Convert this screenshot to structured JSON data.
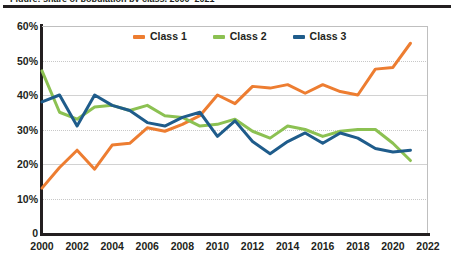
{
  "page": {
    "clipped_heading": "Figure: share of population by class, 2000–2021",
    "background_color": "#ffffff"
  },
  "legend": {
    "position": "top-center",
    "items": [
      {
        "label": "Class 1",
        "color": "#ED7D31",
        "swatch": "line-swatch"
      },
      {
        "label": "Class 2",
        "color": "#8CC152",
        "swatch": "line-swatch"
      },
      {
        "label": "Class 3",
        "color": "#1F5C8B",
        "swatch": "line-swatch"
      }
    ]
  },
  "axes": {
    "y_ticks": [
      "0",
      "10%",
      "20%",
      "30%",
      "40%",
      "50%",
      "60%"
    ],
    "y_tick_values": [
      0,
      10,
      20,
      30,
      40,
      50,
      60
    ],
    "x_ticks": [
      "2000",
      "2002",
      "2004",
      "2006",
      "2008",
      "2010",
      "2012",
      "2014",
      "2016",
      "2018",
      "2020",
      "2022"
    ],
    "x_tick_values": [
      2000,
      2002,
      2004,
      2006,
      2008,
      2010,
      2012,
      2014,
      2016,
      2018,
      2020,
      2022
    ]
  },
  "chart_data": {
    "type": "line",
    "title": "",
    "subtitle": "",
    "xlabel": "",
    "ylabel": "",
    "xlim": [
      2000,
      2022
    ],
    "ylim": [
      0,
      60
    ],
    "grid": true,
    "grid_axis": "y",
    "legend_position": "top-center",
    "x": [
      2000,
      2001,
      2002,
      2003,
      2004,
      2005,
      2006,
      2007,
      2008,
      2009,
      2010,
      2011,
      2012,
      2013,
      2014,
      2015,
      2016,
      2017,
      2018,
      2019,
      2020,
      2021
    ],
    "series": [
      {
        "name": "Class 1",
        "color": "#ED7D31",
        "values": [
          13,
          19,
          24,
          18.5,
          25.5,
          26,
          30.5,
          29.5,
          31.5,
          34,
          40,
          37.5,
          42.5,
          42,
          43,
          40.5,
          43,
          41,
          40,
          47.5,
          48,
          55
        ]
      },
      {
        "name": "Class 2",
        "color": "#8CC152",
        "values": [
          47,
          35,
          33,
          36.5,
          37,
          35.5,
          37,
          34,
          33.5,
          31,
          31.5,
          33,
          29.5,
          27.5,
          31,
          30,
          28,
          29.5,
          30,
          30,
          26,
          21
        ]
      },
      {
        "name": "Class 3",
        "color": "#1F5C8B",
        "values": [
          38,
          40,
          31,
          40,
          37,
          35.5,
          32,
          31,
          33.5,
          35,
          28,
          32.5,
          26.5,
          23,
          26.5,
          29,
          26,
          29,
          27.5,
          24.5,
          23.5,
          24
        ]
      }
    ]
  }
}
